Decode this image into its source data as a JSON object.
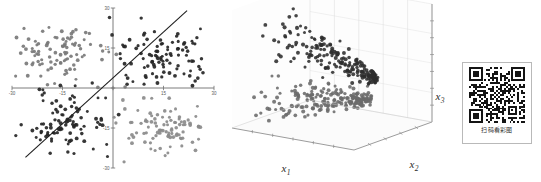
{
  "figure": {
    "title": "",
    "background": "#ffffff",
    "panels": [
      "scatter-2d-four-clusters",
      "scatter-3d-two-clusters",
      "qr-code-block"
    ]
  },
  "qr": {
    "caption": "扫码看彩图",
    "alt_name": "qr-code",
    "border_color": "#b9b9b9",
    "module_dark": "#141414",
    "module_light": "#ffffff"
  },
  "colors": {
    "axis": "#6e6e6e",
    "line": "#1c1c1c",
    "cluster_dark": "#2a2a2a",
    "cluster_mid": "#6f6f6f",
    "cluster_light": "#8f8f8f",
    "grid": "#d6d6d6",
    "pane": "#fbfbfb"
  },
  "chart_data": [
    {
      "type": "scatter",
      "name": "two-dimensional-four-cluster-scatter",
      "title": "",
      "xlabel": "",
      "ylabel": "",
      "xlim": [
        -30,
        30
      ],
      "ylim": [
        -30,
        30
      ],
      "grid": false,
      "legend": null,
      "axis_style": "centered-cross",
      "xticks": [
        -30,
        -15,
        0,
        15,
        30
      ],
      "yticks": [
        -30,
        -15,
        0,
        15,
        30
      ],
      "annotations": [
        {
          "kind": "line",
          "name": "decision-boundary",
          "x0": -26,
          "y0": -26,
          "x1": 22,
          "y1": 29,
          "color": "#1c1c1c",
          "width": 1.1
        }
      ],
      "series": [
        {
          "name": "cluster-upper-left",
          "color": "#7a7a7a",
          "center": [
            -16,
            14
          ],
          "spread": [
            6.5,
            5.5
          ],
          "n": 95
        },
        {
          "name": "cluster-upper-right",
          "color": "#262626",
          "center": [
            14,
            12
          ],
          "spread": [
            6.5,
            5.0
          ],
          "n": 100
        },
        {
          "name": "cluster-lower-left",
          "color": "#262626",
          "center": [
            -14,
            -13
          ],
          "spread": [
            6.5,
            5.0
          ],
          "n": 95
        },
        {
          "name": "cluster-lower-right",
          "color": "#8b8b8b",
          "center": [
            15,
            -14
          ],
          "spread": [
            6.5,
            5.2
          ],
          "n": 95
        }
      ]
    },
    {
      "type": "scatter",
      "name": "three-dimensional-two-cluster-scatter",
      "title": "",
      "xlabel": "x₁",
      "ylabel": "x₂",
      "zlabel": "x₃",
      "grid": true,
      "legend": null,
      "axis_labels": {
        "x": "x",
        "x_sub": "1",
        "y": "x",
        "y_sub": "2",
        "z": "x",
        "z_sub": "3"
      },
      "z_ticks": 6,
      "x_ticks": 5,
      "y_ticks": 4,
      "series": [
        {
          "name": "cluster-upper-dark",
          "color": "#2e2e2e",
          "n": 210,
          "description": "dense elongated wedge sloping up-right"
        },
        {
          "name": "cluster-lower-mid",
          "color": "#6a6a6a",
          "n": 210,
          "description": "elongated wedge sloping down-right below upper cluster"
        }
      ]
    }
  ]
}
